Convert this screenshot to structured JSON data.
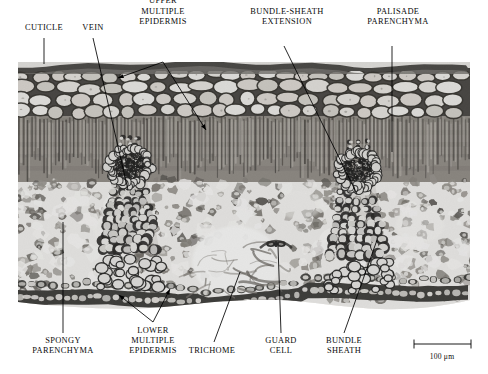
{
  "figure": {
    "kind": "light-micrograph",
    "width": 488,
    "height": 374,
    "background_color": "#ffffff",
    "ink_color": "#0a0a0a"
  },
  "labels": [
    {
      "id": "cuticle",
      "text": "CUTICLE",
      "x": 44,
      "y": 31,
      "anchor": "bottom",
      "leader": {
        "type": "line",
        "from": [
          44,
          38
        ],
        "to": [
          44,
          64
        ]
      }
    },
    {
      "id": "vein",
      "text": "VEIN",
      "x": 93,
      "y": 31,
      "anchor": "bottom",
      "leader": {
        "type": "line",
        "from": [
          93,
          38
        ],
        "to": [
          128,
          190
        ]
      }
    },
    {
      "id": "upper-multiple-epidermis",
      "text": "UPPER\nMULTIPLE\nEPIDERMIS",
      "x": 163,
      "y": 25,
      "anchor": "bottom",
      "leader": {
        "type": "double-arrow",
        "apex": [
          163,
          62
        ],
        "tips": [
          [
            118,
            78
          ],
          [
            206,
            130
          ]
        ]
      }
    },
    {
      "id": "bundle-sheath-extension",
      "text": "BUNDLE-SHEATH\nEXTENSION",
      "x": 287,
      "y": 25,
      "anchor": "bottom",
      "leader": {
        "type": "line",
        "from": [
          284,
          46
        ],
        "to": [
          357,
          194
        ]
      }
    },
    {
      "id": "palisade-parenchyma",
      "text": "PALISADE\nPARENCHYMA",
      "x": 398,
      "y": 25,
      "anchor": "bottom",
      "leader": {
        "type": "line",
        "from": [
          392,
          46
        ],
        "to": [
          392,
          152
        ]
      }
    },
    {
      "id": "spongy-parenchyma",
      "text": "SPONGY\nPARENCHYMA",
      "x": 63,
      "y": 336,
      "anchor": "top",
      "leader": {
        "type": "line",
        "from": [
          63,
          333
        ],
        "to": [
          63,
          222
        ]
      }
    },
    {
      "id": "lower-multiple-epidermis",
      "text": "LOWER\nMULTIPLE\nEPIDERMIS",
      "x": 153,
      "y": 326,
      "anchor": "top",
      "leader": {
        "type": "double-arrow",
        "apex": [
          153,
          322
        ],
        "tips": [
          [
            119,
            295
          ],
          [
            170,
            289
          ]
        ]
      }
    },
    {
      "id": "trichome",
      "text": "TRICHOME",
      "x": 212,
      "y": 346,
      "anchor": "top",
      "leader": {
        "type": "line",
        "from": [
          214,
          342
        ],
        "to": [
          240,
          272
        ]
      }
    },
    {
      "id": "guard-cell",
      "text": "GUARD\nCELL",
      "x": 281,
      "y": 336,
      "anchor": "top",
      "leader": {
        "type": "line",
        "from": [
          281,
          333
        ],
        "to": [
          278,
          246
        ]
      }
    },
    {
      "id": "bundle-sheath",
      "text": "BUNDLE\nSHEATH",
      "x": 344,
      "y": 336,
      "anchor": "top",
      "leader": {
        "type": "line",
        "from": [
          344,
          333
        ],
        "to": [
          377,
          240
        ]
      }
    }
  ],
  "scale_bar": {
    "text": "100 μm",
    "left": 414,
    "right": 471,
    "y": 344,
    "label_x": 442,
    "label_y": 352,
    "tick_height": 9
  },
  "micrograph": {
    "bounds": {
      "x": 18,
      "y": 62,
      "width": 452,
      "height": 248
    },
    "tones": {
      "cuticle": "#4a4845",
      "epidermis_wall": "#2d2b29",
      "epidermis_lumen": "#e2e0dc",
      "palisade_dark": "#55514c",
      "palisade_mid": "#7d7972",
      "mesophyll_light": "#f2f1ee",
      "spongy_wall": "#5f5b56",
      "airspace": "#fbfaf8",
      "vascular_dark": "#1a1917",
      "bundle_sheath_cell": "#ededea"
    },
    "layers": [
      {
        "name": "cuticle",
        "top": 62,
        "bottom": 70
      },
      {
        "name": "upper multiple epidermis",
        "top": 70,
        "bottom": 118
      },
      {
        "name": "palisade parenchyma",
        "top": 118,
        "bottom": 178
      },
      {
        "name": "spongy parenchyma",
        "top": 178,
        "bottom": 292
      },
      {
        "name": "lower multiple epidermis",
        "top": 292,
        "bottom": 308
      }
    ],
    "vascular_bundles": [
      {
        "name": "left vein",
        "cx": 130,
        "cy": 196,
        "rx": 26,
        "ry": 58
      },
      {
        "name": "right vein",
        "cx": 358,
        "cy": 200,
        "rx": 26,
        "ry": 58
      }
    ],
    "trichome": {
      "cx": 242,
      "cy": 268,
      "spread": 38
    },
    "stoma": {
      "cx": 276,
      "cy": 244
    }
  }
}
